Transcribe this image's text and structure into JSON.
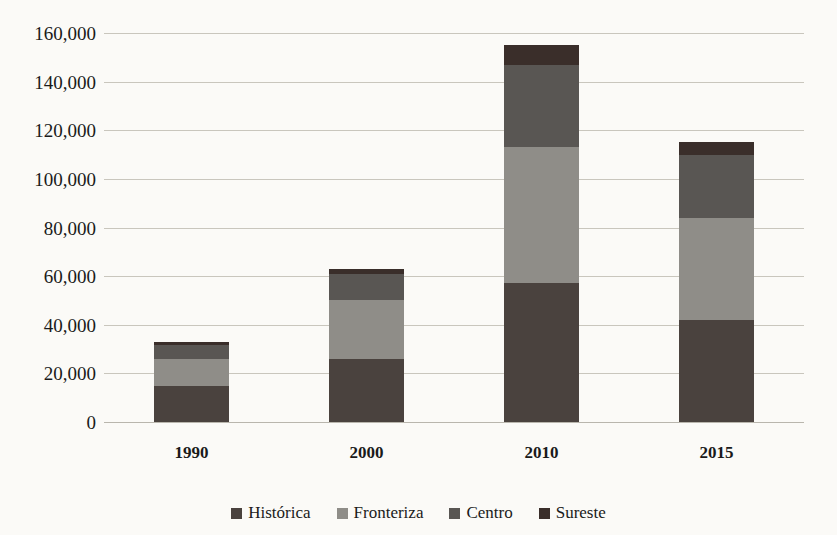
{
  "chart": {
    "title": "",
    "type": "stacked-bar"
  },
  "chart_data": {
    "type": "bar",
    "stacked": true,
    "title": "",
    "subtitle": "",
    "xlabel": "",
    "ylabel": "",
    "categories": [
      "1990",
      "2000",
      "2010",
      "2015"
    ],
    "series": [
      {
        "name": "Histórica",
        "color": "#4a423e",
        "values": [
          15000,
          26000,
          57000,
          42000
        ]
      },
      {
        "name": "Fronteriza",
        "color": "#8f8d88",
        "values": [
          11000,
          24000,
          56000,
          42000
        ]
      },
      {
        "name": "Centro",
        "color": "#595653",
        "values": [
          5500,
          11000,
          34000,
          26000
        ]
      },
      {
        "name": "Sureste",
        "color": "#3a2e2a",
        "values": [
          1500,
          2000,
          8000,
          5000
        ]
      }
    ],
    "totals": [
      33000,
      63000,
      155000,
      115000
    ],
    "ylim": [
      0,
      160000
    ],
    "ytick_step": 20000,
    "yticks": [
      "0",
      "20,000",
      "40,000",
      "60,000",
      "80,000",
      "100,000",
      "120,000",
      "140,000",
      "160,000"
    ],
    "ytick_values": [
      0,
      20000,
      40000,
      60000,
      80000,
      100000,
      120000,
      140000,
      160000
    ],
    "grid": true,
    "legend_position": "bottom"
  },
  "axis": {
    "y_ticks": [
      {
        "label": "160,000",
        "value": 160000
      },
      {
        "label": "140,000",
        "value": 140000
      },
      {
        "label": "120,000",
        "value": 120000
      },
      {
        "label": "100,000",
        "value": 100000
      },
      {
        "label": "80,000",
        "value": 80000
      },
      {
        "label": "60,000",
        "value": 60000
      },
      {
        "label": "40,000",
        "value": 40000
      },
      {
        "label": "20,000",
        "value": 20000
      },
      {
        "label": "0",
        "value": 0
      }
    ],
    "x_ticks": [
      "1990",
      "2000",
      "2010",
      "2015"
    ]
  },
  "legend": {
    "items": [
      {
        "label": "Histórica",
        "color": "#4a423e"
      },
      {
        "label": "Fronteriza",
        "color": "#8f8d88"
      },
      {
        "label": "Centro",
        "color": "#595653"
      },
      {
        "label": "Sureste",
        "color": "#3a2e2a"
      }
    ]
  }
}
